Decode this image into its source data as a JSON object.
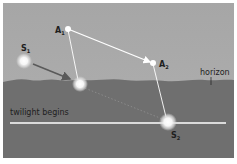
{
  "diagram": {
    "labels": {
      "a1": "A",
      "a1_sub": "1",
      "a2": "A",
      "a2_sub": "2",
      "s1": "S",
      "s1_sub": "1",
      "s2": "S",
      "s2_sub": "2",
      "horizon": "horizon",
      "twilight": "twilight begins"
    },
    "colors": {
      "sky": "#a9a9a9",
      "ground": "#6f6f6f",
      "line": "#ffffff",
      "arrow": "#5a5a5a",
      "text": "#1e1e1e"
    }
  }
}
